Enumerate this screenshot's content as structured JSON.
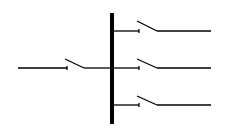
{
  "diagram": {
    "type": "single-line electrical schematic",
    "colors": {
      "background": "#ffffff",
      "line": "#000000"
    },
    "busbar": {
      "x": 112,
      "y1": 13,
      "y2": 124,
      "width": 4
    },
    "incoming_feeder": {
      "line_start_x": 18,
      "y": 68,
      "switch": {
        "contact_x": 67,
        "blade_start": [
          65,
          59
        ],
        "blade_end": [
          84,
          68
        ],
        "state": "open"
      }
    },
    "outgoing_feeders": [
      {
        "y": 31,
        "stub_end_x": 139,
        "blade_start": [
          137,
          21
        ],
        "blade_end": [
          157,
          31
        ],
        "line_end_x": 211,
        "state": "open"
      },
      {
        "y": 68,
        "stub_end_x": 139,
        "blade_start": [
          137,
          59
        ],
        "blade_end": [
          157,
          68
        ],
        "line_end_x": 211,
        "state": "open"
      },
      {
        "y": 105,
        "stub_end_x": 139,
        "blade_start": [
          137,
          96
        ],
        "blade_end": [
          157,
          105
        ],
        "line_end_x": 211,
        "state": "open"
      }
    ]
  }
}
